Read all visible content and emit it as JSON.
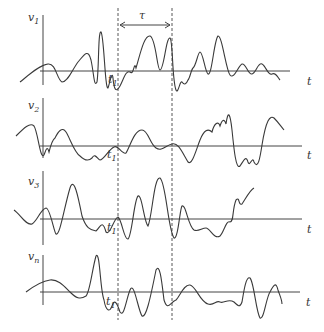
{
  "diagram": {
    "tau_label": "τ",
    "time_axis_label": "t",
    "time_point_label": "t",
    "time_point_sub": "1",
    "signals": [
      {
        "name": "v",
        "sub": "1"
      },
      {
        "name": "v",
        "sub": "2"
      },
      {
        "name": "v",
        "sub": "3"
      },
      {
        "name": "v",
        "sub": "n"
      }
    ],
    "colors": {
      "line": "#3a3a3a",
      "background": "#ffffff"
    }
  }
}
